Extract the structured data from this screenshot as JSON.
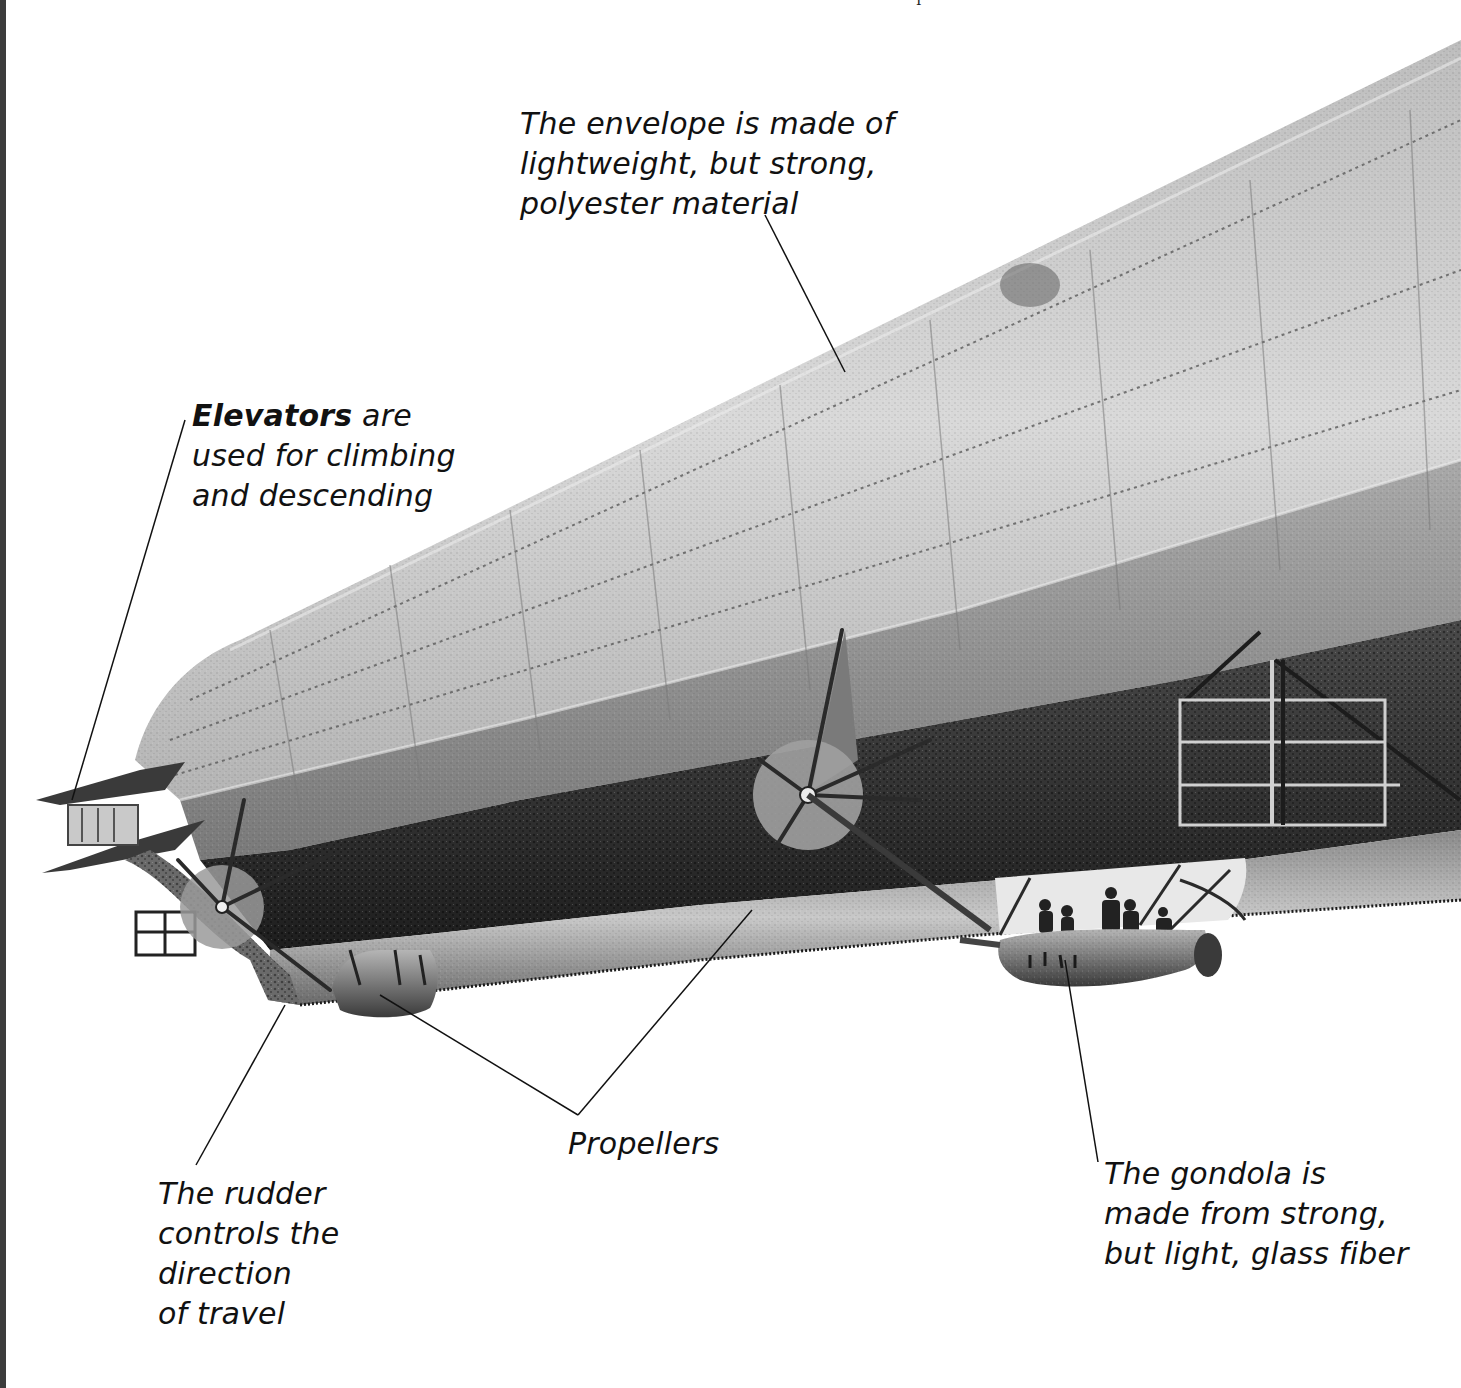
{
  "figure": {
    "colors": {
      "background": "#ffffff",
      "envelope_light": "#cfcfcf",
      "envelope_mid": "#a8a8a8",
      "envelope_dark": "#5a5a5a",
      "underside": "#2e2e2e",
      "leader_line": "#111111",
      "text": "#111111",
      "left_strip": "#3c3c3c"
    }
  },
  "labels": {
    "envelope": {
      "lines": [
        "The envelope is made of",
        "lightweight, but strong,",
        "polyester material"
      ]
    },
    "elevators": {
      "bold": "Elevators",
      "rest_first_line": " are",
      "lines": [
        "used for climbing",
        "and descending"
      ]
    },
    "propellers": {
      "text": "Propellers"
    },
    "rudder": {
      "lines": [
        "The rudder",
        "controls the",
        "direction",
        "of travel"
      ]
    },
    "gondola": {
      "lines": [
        "The gondola is",
        "made from strong,",
        "but light, glass fiber"
      ]
    }
  },
  "parts": [
    {
      "id": "envelope",
      "name": "Envelope"
    },
    {
      "id": "elevators",
      "name": "Elevators"
    },
    {
      "id": "rudder",
      "name": "Rudder"
    },
    {
      "id": "propeller-rear",
      "name": "Rear propeller"
    },
    {
      "id": "propeller-front",
      "name": "Front propeller"
    },
    {
      "id": "gondola",
      "name": "Gondola"
    },
    {
      "id": "rear-pod",
      "name": "Rear engine pod"
    },
    {
      "id": "internal-frame",
      "name": "Internal frame structure"
    }
  ]
}
